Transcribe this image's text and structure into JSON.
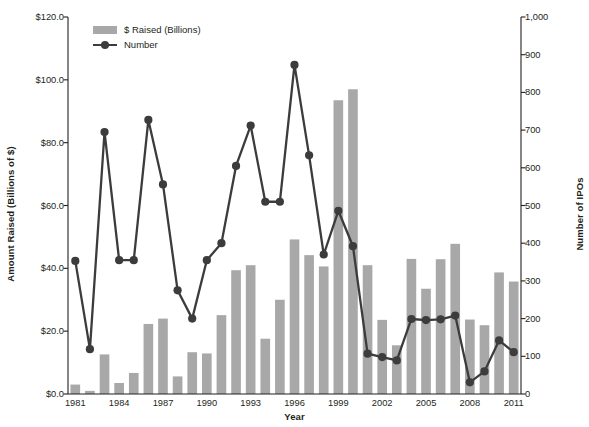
{
  "chart_data": {
    "type": "bar",
    "title": "",
    "xlabel": "Year",
    "ylabel": "Amount Raised (Billions of $)",
    "y2label": "Number of IPOs",
    "ylim": [
      0,
      120
    ],
    "y2lim": [
      0,
      1000
    ],
    "grid": false,
    "legend_position": "top-left",
    "categories": [
      1981,
      1982,
      1983,
      1984,
      1985,
      1986,
      1987,
      1988,
      1989,
      1990,
      1991,
      1992,
      1993,
      1994,
      1995,
      1996,
      1997,
      1998,
      1999,
      2000,
      2001,
      2002,
      2003,
      2004,
      2005,
      2006,
      2007,
      2008,
      2009,
      2010,
      2011
    ],
    "tick_labels_x": [
      "1981",
      "1984",
      "1987",
      "1990",
      "1993",
      "1996",
      "1999",
      "2002",
      "2005",
      "2008",
      "2011"
    ],
    "tick_labels_y": [
      "$0.0",
      "$20.0",
      "$40.0",
      "$60.0",
      "$80.0",
      "$100.0",
      "$120.0"
    ],
    "tick_labels_y2": [
      "0",
      "100",
      "200",
      "300",
      "400",
      "500",
      "600",
      "700",
      "800",
      "900",
      "1,000"
    ],
    "series": [
      {
        "name": "$ Raised (Billions)",
        "type": "bar",
        "axis": "left",
        "color": "#a8a8a8",
        "values": [
          3.0,
          1.0,
          12.6,
          3.5,
          6.7,
          22.3,
          24.0,
          5.6,
          13.3,
          12.9,
          25.1,
          39.4,
          41.0,
          17.6,
          30.0,
          49.2,
          44.2,
          40.6,
          93.5,
          97.0,
          41.0,
          23.6,
          15.5,
          43.0,
          33.5,
          42.9,
          47.8,
          23.7,
          21.9,
          38.7,
          35.8
        ]
      },
      {
        "name": "Number",
        "type": "line",
        "axis": "right",
        "color": "#3c3c3c",
        "values": [
          353,
          119,
          695,
          355,
          355,
          727,
          556,
          275,
          200,
          355,
          400,
          605,
          712,
          510,
          510,
          873,
          633,
          370,
          486,
          392,
          107,
          98,
          89,
          199,
          196,
          198,
          208,
          31,
          60,
          142,
          111
        ]
      }
    ]
  },
  "legend": {
    "items": [
      {
        "label": "$ Raised (Billions)",
        "marker": "bar-swatch"
      },
      {
        "label": "Number",
        "marker": "line-marker"
      }
    ]
  },
  "colors": {
    "bar": "#a8a8a8",
    "line": "#3c3c3c",
    "axis": "#231f20",
    "background": "#ffffff"
  }
}
